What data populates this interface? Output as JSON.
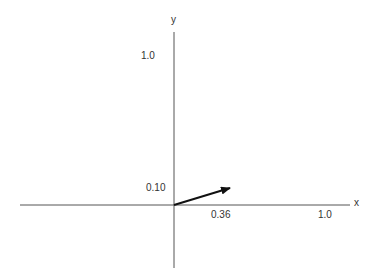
{
  "diagram": {
    "type": "vector-on-axes",
    "axes": {
      "x_label": "x",
      "y_label": "y",
      "x_tick_label": "1.0",
      "y_tick_label": "1.0"
    },
    "vector": {
      "x_component_label": "0.36",
      "y_component_label": "0.10",
      "x": 0.36,
      "y": 0.1
    },
    "colors": {
      "axis": "#555555",
      "vector": "#111111",
      "text": "#333333",
      "background": "#ffffff"
    }
  }
}
